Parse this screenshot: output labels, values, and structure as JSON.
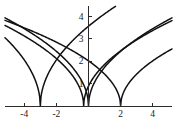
{
  "chart_data": {
    "type": "line",
    "title": "",
    "subtitle": "",
    "xlabel": "",
    "ylabel": "",
    "xlim": [
      -5.2,
      5.2
    ],
    "ylim": [
      0,
      4.45
    ],
    "grid": false,
    "legend": "none",
    "background_color": "#ffffff",
    "curve_color": "#111111",
    "axis_color": "#2b2b2b",
    "xticks": [
      -4,
      -2,
      2,
      4
    ],
    "xtick_labels": [
      "-4",
      "-2",
      "2",
      "4"
    ],
    "yticks": [
      1,
      2,
      3,
      4
    ],
    "ytick_labels": [
      "1",
      "2",
      "3",
      "4"
    ],
    "series": [
      {
        "name": "curve-1",
        "vertex_x": -3,
        "amplitude": 2.05,
        "x": [
          -5.2,
          -4.8,
          -4.4,
          -4.0,
          -3.6,
          -3.3,
          -3.1,
          -3.0,
          -2.9,
          -2.7,
          -2.4,
          -2.0,
          -1.6,
          -1.2,
          -0.8,
          -0.4,
          0.0
        ],
        "y": [
          2.96,
          2.76,
          2.55,
          2.31,
          2.02,
          1.74,
          1.45,
          0.0,
          1.45,
          1.73,
          2.01,
          2.31,
          2.54,
          2.75,
          2.94,
          3.11,
          3.55
        ]
      },
      {
        "name": "curve-2",
        "vertex_x": -0.3,
        "amplitude": 1.62,
        "x": [
          -5.2,
          -4.6,
          -4.0,
          -3.4,
          -2.8,
          -2.2,
          -1.6,
          -1.0,
          -0.6,
          -0.4,
          -0.3,
          -0.2,
          0.0,
          0.4,
          1.0,
          1.8,
          2.6,
          3.4,
          4.2,
          5.2
        ],
        "y": [
          3.57,
          3.34,
          3.1,
          2.84,
          2.56,
          2.25,
          1.88,
          1.41,
          1.05,
          0.86,
          0.0,
          0.86,
          1.05,
          1.41,
          1.83,
          2.33,
          2.74,
          3.08,
          3.39,
          3.74
        ]
      },
      {
        "name": "curve-3",
        "vertex_x": 0,
        "amplitude": 1.72,
        "x": [
          -5.2,
          -4.6,
          -4.0,
          -3.4,
          -2.8,
          -2.2,
          -1.6,
          -1.0,
          -0.6,
          -0.3,
          0.0,
          0.3,
          0.6,
          1.0,
          1.6,
          2.2,
          2.8,
          3.4,
          4.0,
          4.6,
          5.2
        ],
        "y": [
          3.92,
          3.69,
          3.44,
          3.17,
          2.88,
          2.55,
          2.18,
          1.72,
          1.33,
          0.94,
          0.0,
          0.94,
          1.33,
          1.72,
          2.18,
          2.55,
          2.88,
          3.17,
          3.44,
          3.69,
          3.92
        ]
      },
      {
        "name": "curve-4",
        "vertex_x": 2,
        "amplitude": 1.42,
        "x": [
          -5.2,
          -4.6,
          -4.0,
          -3.4,
          -2.8,
          -2.2,
          -1.6,
          -1.0,
          -0.4,
          0.2,
          0.8,
          1.4,
          1.8,
          2.0,
          2.2,
          2.6,
          3.2,
          3.8,
          4.4,
          5.2
        ],
        "y": [
          3.76,
          3.59,
          3.42,
          3.23,
          3.04,
          2.83,
          2.61,
          2.37,
          2.1,
          1.79,
          1.42,
          0.92,
          0.63,
          0.0,
          0.63,
          1.09,
          1.55,
          1.89,
          2.18,
          2.49
        ]
      }
    ]
  },
  "axes": {
    "x_axis_name": "horizontal-axis",
    "y_axis_name": "vertical-axis"
  }
}
